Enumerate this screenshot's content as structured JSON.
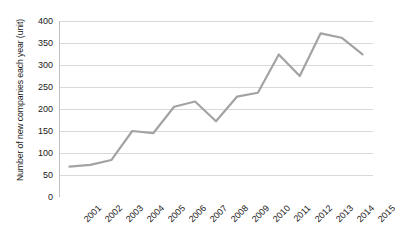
{
  "chart_data": {
    "type": "line",
    "title": "",
    "xlabel": "",
    "ylabel": "Number of new companies each year (unit)",
    "categories": [
      "2001",
      "2002",
      "2003",
      "2004",
      "2005",
      "2006",
      "2007",
      "2008",
      "2009",
      "2010",
      "2011",
      "2012",
      "2013",
      "2014",
      "2015"
    ],
    "values": [
      69,
      73,
      84,
      150,
      145,
      205,
      217,
      172,
      228,
      237,
      324,
      275,
      372,
      362,
      324
    ],
    "series": [
      {
        "name": "Number of new companies each year",
        "values": [
          69,
          73,
          84,
          150,
          145,
          205,
          217,
          172,
          228,
          237,
          324,
          275,
          372,
          362,
          324
        ]
      }
    ],
    "ylim": [
      0,
      400
    ],
    "yticks": [
      0,
      50,
      100,
      150,
      200,
      250,
      300,
      350,
      400
    ],
    "ytick_labels": [
      "0",
      "50",
      "100",
      "150",
      "200",
      "250",
      "300",
      "350",
      "400"
    ],
    "grid": "horizontal",
    "legend": "none",
    "markers": "none",
    "line_color": "#a3a3a3",
    "line_width": 2.2,
    "grid_color": "#d9d9d9",
    "axis_color": "#bfbfbf",
    "text_color": "#1a1a1a",
    "background": "#ffffff",
    "xtick_rotation": -45
  }
}
